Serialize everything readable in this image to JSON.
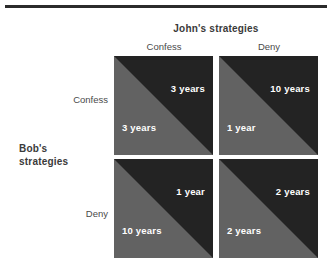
{
  "figure": {
    "column_player": "John's strategies",
    "row_player_line1": "Bob's",
    "row_player_line2": "strategies",
    "column_labels": [
      "Confess",
      "Deny"
    ],
    "row_labels": [
      "Confess",
      "Deny"
    ],
    "colors": {
      "column_payoff_fill": "#232323",
      "row_payoff_fill": "#626262",
      "payoff_text": "#ffffff",
      "label_text": "#4a4a4a",
      "heading_text": "#3a3a3a",
      "rule": "#2b2b2b",
      "background": "#ffffff"
    }
  },
  "chart_data": {
    "type": "table",
    "title": "John's strategies",
    "xlabel": "John's strategies",
    "ylabel": "Bob's strategies",
    "categories": [
      "Confess",
      "Deny"
    ],
    "row_categories": [
      "Confess",
      "Deny"
    ],
    "unit": "years in prison",
    "cells": [
      {
        "row": "Confess",
        "column": "Confess",
        "column_player_payoff": "3 years",
        "row_player_payoff": "3 years",
        "column_player_value": 3,
        "row_player_value": 3
      },
      {
        "row": "Confess",
        "column": "Deny",
        "column_player_payoff": "10 years",
        "row_player_payoff": "1 year",
        "column_player_value": 10,
        "row_player_value": 1
      },
      {
        "row": "Deny",
        "column": "Confess",
        "column_player_payoff": "1 year",
        "row_player_payoff": "10 years",
        "column_player_value": 1,
        "row_player_value": 10
      },
      {
        "row": "Deny",
        "column": "Deny",
        "column_player_payoff": "2 years",
        "row_player_payoff": "2 years",
        "column_player_value": 2,
        "row_player_value": 2
      }
    ]
  }
}
